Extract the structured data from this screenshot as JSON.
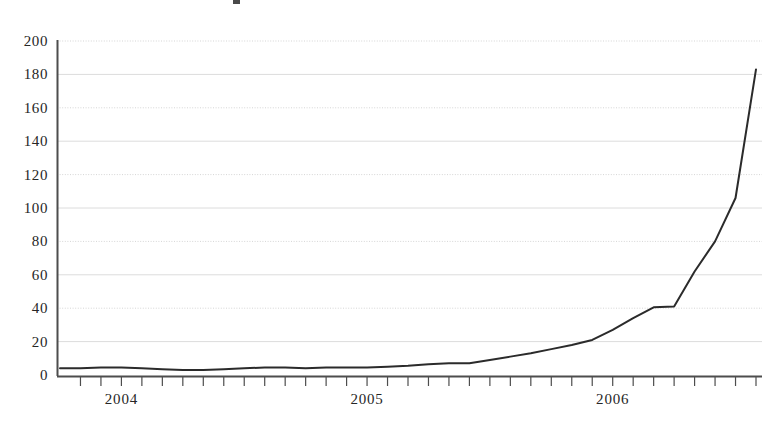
{
  "chart_data": {
    "type": "line",
    "title": "",
    "xlabel": "",
    "ylabel": "",
    "ylim": [
      0,
      200
    ],
    "grid": true,
    "grid_axis": "y",
    "legend": "none",
    "line_color": "#2b2b2b",
    "grid_color": "#d8d8d8",
    "axis_color": "#555555",
    "background_color": "#ffffff",
    "y_ticks": [
      0,
      20,
      40,
      60,
      80,
      100,
      120,
      140,
      160,
      180,
      200
    ],
    "y_tick_labels": [
      "0",
      "20",
      "40",
      "60",
      "80",
      "100",
      "120",
      "140",
      "160",
      "180",
      "200"
    ],
    "x_tick_labels": [
      "2004",
      "2005",
      "2006"
    ],
    "x_tick_positions_month_index": [
      3,
      15,
      27
    ],
    "x_minor_ticks_per_year": 12,
    "x_axis_start_label": "2003-10",
    "x_axis_end_label": "2006-07",
    "categories": [
      "2003-10",
      "2003-11",
      "2003-12",
      "2004-01",
      "2004-02",
      "2004-03",
      "2004-04",
      "2004-05",
      "2004-06",
      "2004-07",
      "2004-08",
      "2004-09",
      "2004-10",
      "2004-11",
      "2004-12",
      "2005-01",
      "2005-02",
      "2005-03",
      "2005-04",
      "2005-05",
      "2005-06",
      "2005-07",
      "2005-08",
      "2005-09",
      "2005-10",
      "2005-11",
      "2005-12",
      "2006-01",
      "2006-02",
      "2006-03",
      "2006-04",
      "2006-05",
      "2006-06",
      "2006-07"
    ],
    "values": [
      4,
      4,
      4.5,
      4.5,
      4,
      3.5,
      3,
      3,
      3.5,
      4,
      4.5,
      4.5,
      4,
      4.5,
      4.5,
      4.5,
      5,
      5.5,
      6.5,
      7,
      7,
      9,
      11,
      13,
      15.5,
      18,
      21,
      27,
      34,
      40.5,
      41,
      62,
      80,
      106
    ],
    "values_extended_note": "final segment continues to 183",
    "final_value": 183,
    "max_value": 183,
    "min_value": 3
  }
}
